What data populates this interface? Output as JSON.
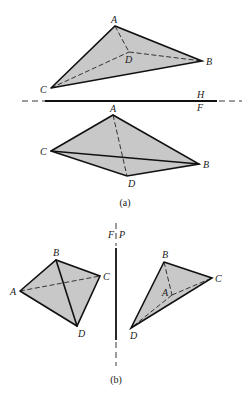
{
  "figure": {
    "panels": [
      {
        "id": "a",
        "caption": "(a)",
        "views": [
          {
            "name": "top-view",
            "vertices": {
              "A": {
                "label": "A",
                "x": 115,
                "y": 26
              },
              "B": {
                "label": "B",
                "x": 202,
                "y": 61
              },
              "C": {
                "label": "C",
                "x": 51,
                "y": 88
              },
              "D": {
                "label": "D",
                "x": 129,
                "y": 52
              }
            },
            "visible_edges": [
              [
                "A",
                "B"
              ],
              [
                "A",
                "C"
              ],
              [
                "B",
                "C"
              ]
            ],
            "hidden_edges": [
              [
                "A",
                "D"
              ],
              [
                "B",
                "D"
              ],
              [
                "C",
                "D"
              ]
            ]
          },
          {
            "name": "front-view",
            "vertices": {
              "A": {
                "label": "A",
                "x": 113,
                "y": 115
              },
              "B": {
                "label": "B",
                "x": 199,
                "y": 164
              },
              "C": {
                "label": "C",
                "x": 51,
                "y": 151
              },
              "D": {
                "label": "D",
                "x": 127,
                "y": 176
              }
            },
            "visible_edges": [
              [
                "A",
                "B"
              ],
              [
                "A",
                "C"
              ],
              [
                "C",
                "B"
              ],
              [
                "C",
                "D"
              ],
              [
                "D",
                "B"
              ]
            ],
            "hidden_edges": [
              [
                "A",
                "D"
              ]
            ]
          }
        ],
        "fold_line": {
          "orientation": "horizontal",
          "label_above": "H",
          "label_below": "F"
        }
      },
      {
        "id": "b",
        "caption": "(b)",
        "views": [
          {
            "name": "front-view-left",
            "vertices": {
              "A": {
                "label": "A",
                "x": 20,
                "y": 291
              },
              "B": {
                "label": "B",
                "x": 56,
                "y": 260
              },
              "C": {
                "label": "C",
                "x": 100,
                "y": 276
              },
              "D": {
                "label": "D",
                "x": 77,
                "y": 326
              }
            },
            "visible_edges": [
              [
                "A",
                "B"
              ],
              [
                "B",
                "C"
              ],
              [
                "C",
                "D"
              ],
              [
                "D",
                "A"
              ],
              [
                "B",
                "D"
              ]
            ],
            "hidden_edges": [
              [
                "A",
                "C"
              ]
            ]
          },
          {
            "name": "profile-view-right",
            "vertices": {
              "A": {
                "label": "A",
                "x": 172,
                "y": 295
              },
              "B": {
                "label": "B",
                "x": 164,
                "y": 262
              },
              "C": {
                "label": "C",
                "x": 212,
                "y": 278
              },
              "D": {
                "label": "D",
                "x": 131,
                "y": 328
              }
            },
            "visible_edges": [
              [
                "B",
                "C"
              ],
              [
                "C",
                "D"
              ],
              [
                "D",
                "B"
              ]
            ],
            "hidden_edges": [
              [
                "B",
                "A"
              ],
              [
                "A",
                "C"
              ],
              [
                "A",
                "D"
              ]
            ]
          }
        ],
        "fold_line": {
          "orientation": "vertical",
          "label_left": "F",
          "label_right": "P"
        }
      }
    ]
  }
}
